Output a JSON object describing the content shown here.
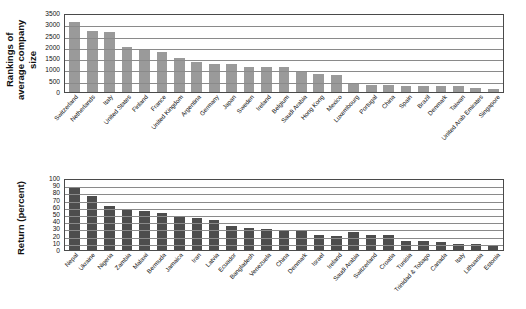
{
  "chart_data": [
    {
      "id": "rankings-average-company-size",
      "type": "bar",
      "title": "",
      "xlabel": "",
      "ylabel": "Rankings of average company size",
      "ylim": [
        0,
        3500
      ],
      "yticks": [
        0,
        500,
        1000,
        1500,
        2000,
        2500,
        3000,
        3500
      ],
      "grid": true,
      "legend": "none",
      "bar_color": "#9a9a9a",
      "categories": [
        "Switzerland",
        "Netherlands",
        "Italy",
        "United States",
        "Finland",
        "France",
        "United Kingdom",
        "Argentina",
        "Germany",
        "Japan",
        "Sweden",
        "Ireland",
        "Belgium",
        "Saudi Arabia",
        "Hong Kong",
        "Mexico",
        "Luxembourg",
        "Portugal",
        "China",
        "Spain",
        "Brazil",
        "Denmark",
        "Taiwan",
        "United Arab Emirates",
        "Singapore"
      ],
      "values": [
        3120,
        2720,
        2650,
        2000,
        1910,
        1790,
        1520,
        1310,
        1260,
        1250,
        1130,
        1120,
        1100,
        880,
        800,
        760,
        410,
        330,
        290,
        280,
        270,
        270,
        260,
        190,
        150
      ]
    },
    {
      "id": "return-percent",
      "type": "bar",
      "title": "",
      "xlabel": "",
      "ylabel": "Return (percent)",
      "ylim": [
        0,
        100
      ],
      "yticks": [
        0,
        10,
        20,
        30,
        40,
        50,
        60,
        70,
        80,
        90,
        100
      ],
      "grid": true,
      "legend": "none",
      "bar_color": "#4d4d4d",
      "categories": [
        "Nepal",
        "Ukraine",
        "Nigeria",
        "Zambia",
        "Malawi",
        "Bermuda",
        "Jamaica",
        "Iran",
        "Latvia",
        "Ecuador",
        "Bangladesh",
        "Venezuela",
        "China",
        "Denmark",
        "Israel",
        "Ireland",
        "Saudi Arabia",
        "Switzerland",
        "Croatia",
        "Tunisia",
        "Trinidad & Tobago",
        "Canada",
        "Italy",
        "Lithuania",
        "Estonia"
      ],
      "values": [
        86,
        75,
        61,
        56,
        54,
        52,
        46,
        45,
        42,
        34,
        30,
        29,
        28,
        28,
        21,
        20,
        25,
        21,
        21,
        13,
        12,
        11,
        9,
        8,
        7
      ]
    }
  ]
}
